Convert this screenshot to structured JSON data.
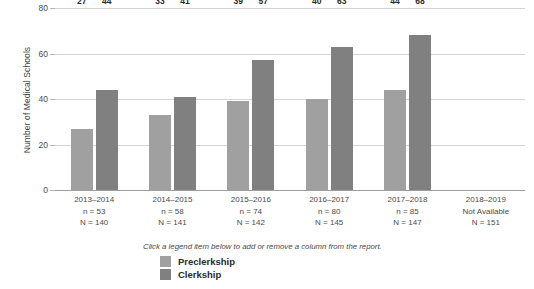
{
  "chart_data": {
    "type": "bar",
    "title": "",
    "xlabel": "",
    "ylabel": "Number of Medical Schools",
    "ylim": [
      0,
      80
    ],
    "yticks": [
      0,
      20,
      40,
      60,
      80
    ],
    "grid": true,
    "legend_position": "bottom-left",
    "categories": [
      "2013–2014",
      "2014–2015",
      "2015–2016",
      "2016–2017",
      "2017–2018",
      "2018–2019"
    ],
    "category_sublabels": [
      [
        "n = 53",
        "N = 140"
      ],
      [
        "n = 58",
        "N = 141"
      ],
      [
        "n = 74",
        "N = 142"
      ],
      [
        "n = 80",
        "N = 145"
      ],
      [
        "n = 85",
        "N = 147"
      ],
      [
        "Not Available",
        "N = 151"
      ]
    ],
    "series": [
      {
        "name": "Preclerkship",
        "color": "#a0a0a0",
        "values": [
          27,
          33,
          39,
          40,
          44,
          null
        ]
      },
      {
        "name": "Clerkship",
        "color": "#808080",
        "values": [
          44,
          41,
          57,
          63,
          68,
          null
        ]
      }
    ]
  },
  "legend": {
    "hint": "Click a legend item below to add or remove a column from the report.",
    "items": [
      {
        "label": "Preclerkship",
        "color": "#a0a0a0"
      },
      {
        "label": "Clerkship",
        "color": "#808080"
      }
    ]
  },
  "axis": {
    "y_title": "Number of Medical Schools",
    "y_tick_labels": [
      "0",
      "20",
      "40",
      "60",
      "80"
    ]
  }
}
